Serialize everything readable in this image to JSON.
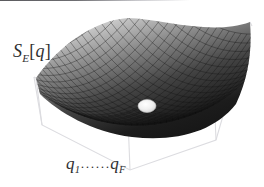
{
  "figure": {
    "name": "euclidean-action-potential-surface",
    "background_color": "#ffffff",
    "width": 264,
    "height": 187
  },
  "labels": {
    "y_axis": {
      "full_text": "S_E[q]",
      "symbol": "S",
      "subscript": "E",
      "open_bracket": "[",
      "argument": "q",
      "close_bracket": "]",
      "color": "#2e2e30"
    },
    "x_axis": {
      "full_text": "q_1......q_F",
      "first_symbol": "q",
      "first_subscript": "1",
      "ellipsis": "······",
      "last_symbol": "q",
      "last_subscript": "F",
      "color": "#2e2e30"
    }
  },
  "chart_data": {
    "type": "surface",
    "title": "",
    "xlabel": "q_1......q_F",
    "ylabel": "",
    "zlabel": "S_E[q]",
    "surface_function": "z = x^2 + y^2",
    "mesh": {
      "u_divisions": 26,
      "v_divisions": 26,
      "grid": true,
      "line_color": "#191919",
      "fill_dark": "#101010",
      "fill_light": "#f2f2f2"
    },
    "axis_box": {
      "visible": true,
      "color": "#d9d9dd",
      "style": "wireframe-open-box"
    },
    "marker": {
      "name": "minimum-ball",
      "shape": "ellipse",
      "x": 147,
      "y": 106,
      "rx": 9,
      "ry": 6.5,
      "fill": "#ededed",
      "stroke": "#b9b9b9",
      "meaning": "stationary point / classical solution at the minimum of the action"
    },
    "xlim": [
      -1,
      1
    ],
    "ylim": [
      -1,
      1
    ],
    "zlim": [
      0,
      2
    ],
    "legend": null,
    "annotations": []
  }
}
